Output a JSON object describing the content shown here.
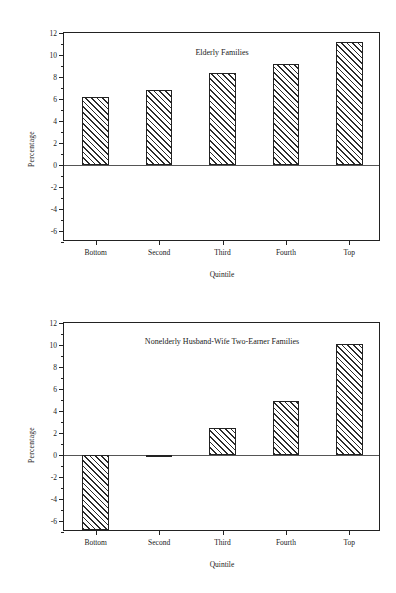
{
  "figure": {
    "panels": [
      {
        "id": "elderly",
        "title": "Elderly Families",
        "ylabel": "Percentage",
        "xlabel": "Quintile"
      },
      {
        "id": "nonelderly",
        "title": "Nonelderly Husband-Wife Two-Earner Families",
        "ylabel": "Percentage",
        "xlabel": "Quintile"
      }
    ]
  },
  "axis": {
    "ytick_labels": [
      "12",
      "10",
      "8",
      "6",
      "4",
      "2",
      "0",
      "-2",
      "-4",
      "-6"
    ],
    "xtick_labels": [
      "Bottom",
      "Second",
      "Third",
      "Fourth",
      "Top"
    ]
  },
  "chart_data": [
    {
      "type": "bar",
      "title": "Elderly Families",
      "xlabel": "Quintile",
      "ylabel": "Percentage",
      "categories": [
        "Bottom",
        "Second",
        "Third",
        "Fourth",
        "Top"
      ],
      "values": [
        6.2,
        6.8,
        8.4,
        9.2,
        11.2
      ],
      "ylim": [
        -7,
        12
      ],
      "yticks": [
        12,
        10,
        8,
        6,
        4,
        2,
        0,
        -2,
        -4,
        -6
      ],
      "grid": false,
      "legend": "none"
    },
    {
      "type": "bar",
      "title": "Nonelderly Husband-Wife Two-Earner Families",
      "xlabel": "Quintile",
      "ylabel": "Percentage",
      "categories": [
        "Bottom",
        "Second",
        "Third",
        "Fourth",
        "Top"
      ],
      "values": [
        -6.8,
        -0.15,
        2.5,
        4.9,
        10.1
      ],
      "ylim": [
        -7,
        12
      ],
      "yticks": [
        12,
        10,
        8,
        6,
        4,
        2,
        0,
        -2,
        -4,
        -6
      ],
      "grid": false,
      "legend": "none"
    }
  ]
}
